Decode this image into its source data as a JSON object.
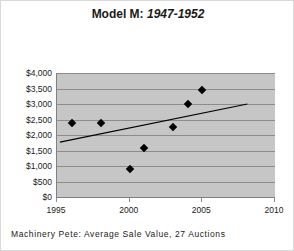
{
  "chart_data": {
    "type": "scatter",
    "title": "Model M: 1947-1952",
    "title_main": "Model M:",
    "title_range": "1947-1952",
    "caption": "Machinery Pete: Average Sale Value, 27 Auctions",
    "xlabel": "",
    "ylabel": "",
    "xlim": [
      1995,
      2010
    ],
    "ylim": [
      0,
      4000
    ],
    "grid": true,
    "legend": "none",
    "xticks": [
      1995,
      2000,
      2005,
      2010
    ],
    "xtick_labels": [
      "1995",
      "2000",
      "2005",
      "2010"
    ],
    "yticks": [
      0,
      500,
      1000,
      1500,
      2000,
      2500,
      3000,
      3500,
      4000
    ],
    "ytick_labels": [
      "$0",
      "$500",
      "$1,000",
      "$1,500",
      "$2,000",
      "$2,500",
      "$3,000",
      "$3,500",
      "$4,000"
    ],
    "points": [
      {
        "x": 1996.0,
        "y": 2400
      },
      {
        "x": 1998.0,
        "y": 2400
      },
      {
        "x": 2000.0,
        "y": 900
      },
      {
        "x": 2001.0,
        "y": 1580
      },
      {
        "x": 2003.0,
        "y": 2250
      },
      {
        "x": 2004.0,
        "y": 3000
      },
      {
        "x": 2005.0,
        "y": 3450
      }
    ],
    "series": [
      {
        "name": "Average Sale Value",
        "marker": "diamond",
        "color": "#000000",
        "x": [
          1996.0,
          1998.0,
          2000.0,
          2001.0,
          2003.0,
          2004.0,
          2005.0
        ],
        "values": [
          2400,
          2400,
          900,
          1580,
          2250,
          3000,
          3450
        ]
      }
    ],
    "trendline": {
      "type": "linear",
      "color": "#000000",
      "x": [
        1995.2,
        2008.1
      ],
      "y": [
        1770,
        3000
      ]
    },
    "colors": {
      "plot_background": "#c6c6c6",
      "gridline": "#8c8c8c",
      "axis": "#808080",
      "marker": "#000000",
      "text": "#1a1a1a",
      "figure_background": "#ffffff"
    }
  }
}
